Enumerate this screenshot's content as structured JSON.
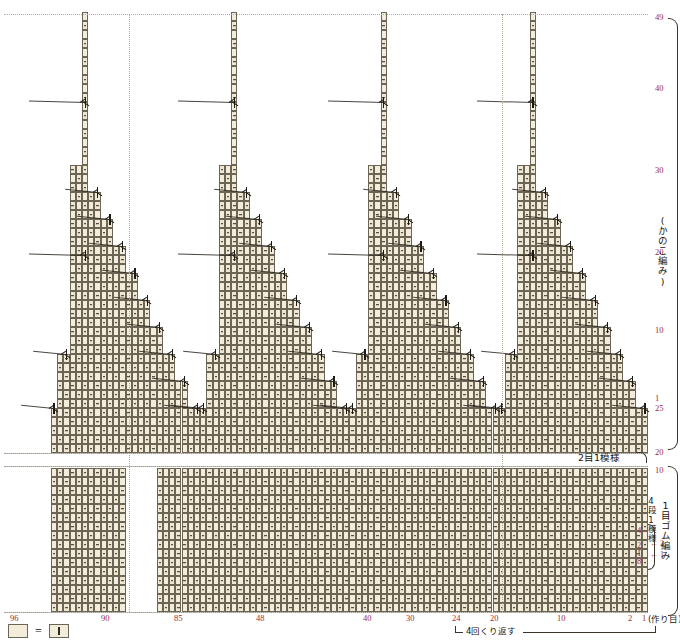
{
  "chart_data": {
    "type": "table",
    "grid": {
      "cell_width": 6.22,
      "cell_height": 9.0,
      "stitch_columns_total": 96,
      "row_count_upper": 49,
      "row_count_lower": 25
    },
    "sections": [
      {
        "name": "upper",
        "label": "(かのこ編み)",
        "rows": 49,
        "row_ticks": [
          1,
          10,
          20,
          30,
          40,
          49
        ],
        "repeat_label": "2目1模様"
      },
      {
        "name": "lower",
        "label": "1目ゴム編み",
        "rows": 25,
        "row_ticks": [
          10,
          20,
          25
        ],
        "repeat_label": "4段1模様",
        "cast_on_label": "(作り目)"
      }
    ],
    "x_axis": {
      "label": "",
      "ticks": [
        {
          "value": 96,
          "x": 10
        },
        {
          "value": 90,
          "x": 101
        },
        {
          "value": 85,
          "x": 174
        },
        {
          "value": 48,
          "x": 256
        },
        {
          "value": 40,
          "x": 363
        },
        {
          "value": 30,
          "x": 406
        },
        {
          "value": 24,
          "x": 452
        },
        {
          "value": 20,
          "x": 490
        },
        {
          "value": 10,
          "x": 557
        },
        {
          "value": 2,
          "x": 628
        },
        {
          "value": 1,
          "x": 642
        }
      ]
    },
    "y_axis_right": {
      "upper_ticks": [
        {
          "value": 49,
          "y": 17
        },
        {
          "value": 40,
          "y": 88
        },
        {
          "value": 30,
          "y": 170
        },
        {
          "value": 20,
          "y": 252
        },
        {
          "value": 10,
          "y": 330
        },
        {
          "value": 1,
          "y": 398
        }
      ],
      "lower_ticks": [
        {
          "value": 25,
          "y": 408
        },
        {
          "value": 20,
          "y": 452
        },
        {
          "value": 10,
          "y": 470
        },
        {
          "value": 4,
          "y": 530
        },
        {
          "value": 2,
          "y": 545
        },
        {
          "value": 1,
          "y": 553
        },
        {
          "value": 8,
          "y": 561
        }
      ]
    },
    "annotations": {
      "moss_stitch": "(かのこ編み)",
      "rib_stitch": "1目ゴム編み",
      "two_stitch_one_pattern": "2目1模様",
      "four_row_one_pattern": "4段1模様",
      "cast_on": "(作り目)",
      "repeat_four_times": "4回くり返す",
      "row_arrows": [
        "←2",
        "←1"
      ]
    },
    "legend": {
      "empty_symbol": "",
      "equals": "=",
      "knit_symbol": "|",
      "meaning": "blank cell = knit stitch"
    },
    "colors": {
      "cell_fill": "#f3ecda",
      "cell_border": "#6b6555",
      "symbol": "#2e2a22",
      "number": "#9d2a3a",
      "guide": "#b9ad9a",
      "background": "#ffffff"
    }
  }
}
